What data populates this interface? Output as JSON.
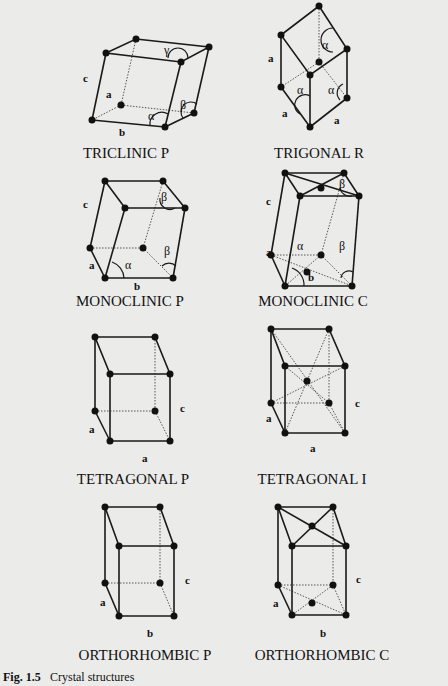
{
  "figure": {
    "caption_number": "Fig. 1.5",
    "caption_text": "Crystal structures"
  },
  "structures": [
    {
      "id": "triclinic-p",
      "title": "TRICLINIC P",
      "labels": {
        "a": "a",
        "b": "b",
        "c": "c"
      },
      "angles": [
        "α",
        "β",
        "γ"
      ]
    },
    {
      "id": "trigonal-r",
      "title": "TRIGONAL R",
      "labels": {
        "a1": "a",
        "a2": "a",
        "a3": "a"
      },
      "angles": [
        "α",
        "α",
        "α"
      ]
    },
    {
      "id": "monoclinic-p",
      "title": "MONOCLINIC P",
      "labels": {
        "a": "a",
        "b": "b",
        "c": "c"
      },
      "angles": [
        "α",
        "β",
        "β"
      ]
    },
    {
      "id": "monoclinic-c",
      "title": "MONOCLINIC C",
      "labels": {
        "a": "a",
        "b": "b",
        "c": "c"
      },
      "angles": [
        "α",
        "β",
        "β"
      ]
    },
    {
      "id": "tetragonal-p",
      "title": "TETRAGONAL P",
      "labels": {
        "a1": "a",
        "a2": "a",
        "c": "c"
      }
    },
    {
      "id": "tetragonal-i",
      "title": "TETRAGONAL I",
      "labels": {
        "a1": "a",
        "a2": "a",
        "c": "c"
      }
    },
    {
      "id": "orthorhombic-p",
      "title": "ORTHORHOMBIC P",
      "labels": {
        "a": "a",
        "b": "b",
        "c": "c"
      }
    },
    {
      "id": "orthorhombic-c",
      "title": "ORTHORHOMBIC C",
      "labels": {
        "a": "a",
        "b": "b",
        "c": "c"
      }
    }
  ]
}
